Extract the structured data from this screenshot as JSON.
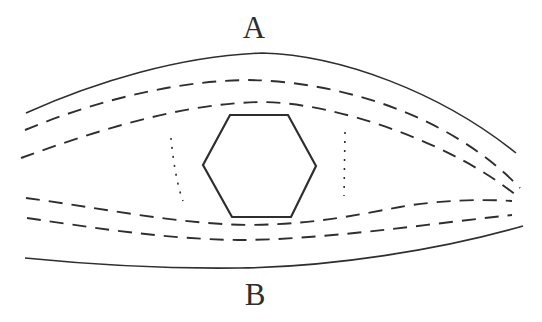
{
  "figure": {
    "background": "#ffffff",
    "ink": "#2e2e2e",
    "labels": {
      "top": "A",
      "bottom": "B"
    },
    "hexagon": {
      "points": "230,115 288,115 316,166 291,217 232,217 203,165"
    },
    "paths": {
      "top_boundary": "M 26 113 C 95 82 180 56 262 53 C 340 55 440 92 516 153",
      "upper_foliation_1": "M 25 130 C 90 103 170 81 248 80 C 330 81 445 110 520 188",
      "upper_foliation_2": "M 21 158 C 90 133 180 103 262 102 C 340 103 455 145 517 196",
      "lower_foliation_1": "M 26 198 C 95 207 175 224 250 225 C 320 224 360 214 400 207 C 440 200 480 199 512 201",
      "lower_foliation_2": "M 27 218 C 95 228 165 239 238 240 C 320 240 420 225 512 215",
      "bottom_boundary": "M 25 258 C 95 265 165 269 240 268 C 330 267 440 250 523 226",
      "left_dotted": "M 171 138 C 173 160 177 185 183 201",
      "right_dotted": "M 345 132 L 344 196"
    },
    "label_positions": {
      "top_x": "254",
      "top_y": "38",
      "bottom_x": "255",
      "bottom_y": "305"
    }
  }
}
